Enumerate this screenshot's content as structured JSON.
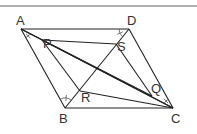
{
  "figure": {
    "type": "geometry-diagram",
    "top_rule_color": "#b0b0b0",
    "line_color": "#222222",
    "points": {
      "A": {
        "label": "A",
        "x": 21,
        "y": 29
      },
      "B": {
        "label": "B",
        "x": 65,
        "y": 108
      },
      "C": {
        "label": "C",
        "x": 173,
        "y": 108
      },
      "D": {
        "label": "D",
        "x": 129,
        "y": 29
      },
      "P": {
        "label": "P",
        "x": 42,
        "y": 40
      },
      "Q": {
        "label": "Q",
        "x": 152,
        "y": 96
      },
      "R": {
        "label": "R",
        "x": 80,
        "y": 91
      },
      "S": {
        "label": "S",
        "x": 116,
        "y": 44
      }
    },
    "segments": [
      [
        "A",
        "D"
      ],
      [
        "D",
        "C"
      ],
      [
        "C",
        "B"
      ],
      [
        "B",
        "A"
      ],
      [
        "A",
        "C"
      ],
      [
        "B",
        "D"
      ],
      [
        "A",
        "Q"
      ],
      [
        "P",
        "S"
      ],
      [
        "P",
        "R"
      ],
      [
        "R",
        "C"
      ],
      [
        "S",
        "Q"
      ],
      [
        "P",
        "C"
      ]
    ],
    "angle_marks": [
      "A",
      "B",
      "C",
      "D"
    ]
  }
}
